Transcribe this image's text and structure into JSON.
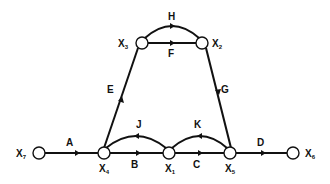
{
  "diagram": {
    "type": "signal-flow-graph",
    "colors": {
      "line": "#111111",
      "node_fill": "#ffffff",
      "background": "#ffffff"
    },
    "nodes": [
      {
        "id": "X7",
        "base": "X",
        "sub": "7",
        "x": 39,
        "y": 153
      },
      {
        "id": "X4",
        "base": "X",
        "sub": "4",
        "x": 104,
        "y": 153
      },
      {
        "id": "X1",
        "base": "X",
        "sub": "1",
        "x": 169,
        "y": 153
      },
      {
        "id": "X5",
        "base": "X",
        "sub": "5",
        "x": 230,
        "y": 153
      },
      {
        "id": "X6",
        "base": "X",
        "sub": "6",
        "x": 293,
        "y": 153
      },
      {
        "id": "X3",
        "base": "X",
        "sub": "3",
        "x": 142,
        "y": 43
      },
      {
        "id": "X2",
        "base": "X",
        "sub": "2",
        "x": 202,
        "y": 43
      }
    ],
    "edges": [
      {
        "label": "A",
        "from": "X7",
        "to": "X4",
        "shape": "straight"
      },
      {
        "label": "B",
        "from": "X4",
        "to": "X1",
        "shape": "straight"
      },
      {
        "label": "C",
        "from": "X1",
        "to": "X5",
        "shape": "straight"
      },
      {
        "label": "D",
        "from": "X5",
        "to": "X6",
        "shape": "straight"
      },
      {
        "label": "J",
        "from": "X1",
        "to": "X4",
        "shape": "arc"
      },
      {
        "label": "K",
        "from": "X5",
        "to": "X1",
        "shape": "arc"
      },
      {
        "label": "E",
        "from": "X4",
        "to": "X3",
        "shape": "straight"
      },
      {
        "label": "F",
        "from": "X3",
        "to": "X2",
        "shape": "straight"
      },
      {
        "label": "H",
        "from": "X3",
        "to": "X2",
        "shape": "arc"
      },
      {
        "label": "G",
        "from": "X2",
        "to": "X5",
        "shape": "straight"
      }
    ]
  }
}
